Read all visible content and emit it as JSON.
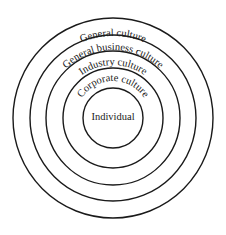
{
  "diagram": {
    "type": "concentric-circles",
    "center_label": "Individual",
    "layers": [
      {
        "label": "Corporate culture",
        "order": 1
      },
      {
        "label": "Industry culture",
        "order": 2
      },
      {
        "label": "General business culture",
        "order": 3
      },
      {
        "label": "General culture",
        "order": 4
      }
    ],
    "colors": {
      "stroke": "#1a1a1a",
      "background": "#ffffff"
    }
  }
}
